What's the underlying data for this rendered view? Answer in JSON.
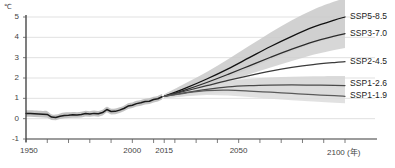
{
  "chart_data": {
    "type": "line",
    "title": "",
    "subtitle": "",
    "xlabel": "年",
    "ylabel": "℃",
    "unit": "℃",
    "xlim": [
      1950,
      2100
    ],
    "ylim": [
      -1,
      5
    ],
    "grid": true,
    "grid_values": [
      0,
      1,
      2,
      3,
      4,
      5
    ],
    "legend_position": "right-inline",
    "annotations": [
      {
        "text": "historical observations end and projections begin",
        "x": 2015
      }
    ],
    "x_tick_labels": [
      "1950",
      "2000",
      "2015",
      "2050",
      "2100"
    ],
    "x_tick_label_extra": "(年)",
    "x_minor_tick_step": 10,
    "y_tick_labels": [
      "5",
      "4",
      "3",
      "2",
      "1",
      "0",
      "-1"
    ],
    "historical": {
      "name": "historical",
      "color": "#1a1a1a",
      "band_color": "#b8b8b8",
      "x": [
        1950,
        1952,
        1954,
        1956,
        1958,
        1960,
        1962,
        1964,
        1966,
        1968,
        1970,
        1972,
        1974,
        1976,
        1978,
        1980,
        1982,
        1984,
        1986,
        1988,
        1990,
        1992,
        1994,
        1996,
        1998,
        2000,
        2002,
        2004,
        2006,
        2008,
        2010,
        2012,
        2014
      ],
      "values": [
        0.26,
        0.25,
        0.24,
        0.23,
        0.22,
        0.21,
        0.08,
        0.06,
        0.12,
        0.16,
        0.17,
        0.19,
        0.18,
        0.2,
        0.25,
        0.23,
        0.26,
        0.24,
        0.3,
        0.45,
        0.35,
        0.36,
        0.42,
        0.5,
        0.62,
        0.66,
        0.74,
        0.78,
        0.84,
        0.86,
        0.94,
        0.98,
        1.08
      ],
      "band_lower": [
        0.1,
        0.09,
        0.08,
        0.07,
        0.06,
        0.05,
        -0.06,
        -0.08,
        -0.02,
        0.02,
        0.03,
        0.05,
        0.04,
        0.06,
        0.11,
        0.09,
        0.12,
        0.1,
        0.16,
        0.31,
        0.21,
        0.22,
        0.28,
        0.36,
        0.48,
        0.52,
        0.6,
        0.64,
        0.7,
        0.72,
        0.8,
        0.84,
        0.94
      ],
      "band_upper": [
        0.42,
        0.41,
        0.4,
        0.39,
        0.38,
        0.37,
        0.22,
        0.2,
        0.26,
        0.3,
        0.31,
        0.33,
        0.32,
        0.34,
        0.39,
        0.37,
        0.4,
        0.38,
        0.44,
        0.59,
        0.49,
        0.5,
        0.56,
        0.64,
        0.76,
        0.8,
        0.88,
        0.92,
        0.98,
        1.0,
        1.08,
        1.12,
        1.22
      ]
    },
    "series": [
      {
        "name": "SSP5-8.5",
        "label": "SSP5-8.5",
        "color": "#111111",
        "band_color": "#c9c9c9",
        "show_band": true,
        "x": [
          2015,
          2025,
          2035,
          2045,
          2055,
          2065,
          2075,
          2085,
          2095,
          2100
        ],
        "values": [
          1.1,
          1.5,
          1.95,
          2.45,
          3.0,
          3.55,
          4.05,
          4.5,
          4.85,
          5.0
        ],
        "band_lower": [
          1.0,
          1.28,
          1.62,
          2.02,
          2.46,
          2.9,
          3.32,
          3.7,
          4.0,
          4.12
        ],
        "band_upper": [
          1.2,
          1.74,
          2.3,
          2.92,
          3.58,
          4.24,
          4.84,
          5.36,
          5.76,
          5.92
        ],
        "end_value": 5.0
      },
      {
        "name": "SSP3-7.0",
        "label": "SSP3-7.0",
        "color": "#2b2b2b",
        "band_color": "#d0d0d0",
        "show_band": true,
        "x": [
          2015,
          2025,
          2035,
          2045,
          2055,
          2065,
          2075,
          2085,
          2095,
          2100
        ],
        "values": [
          1.1,
          1.42,
          1.78,
          2.18,
          2.6,
          3.02,
          3.42,
          3.78,
          4.06,
          4.18
        ],
        "band_lower": [
          1.0,
          1.24,
          1.52,
          1.84,
          2.18,
          2.52,
          2.84,
          3.14,
          3.38,
          3.48
        ],
        "band_upper": [
          1.2,
          1.62,
          2.06,
          2.54,
          3.04,
          3.54,
          4.02,
          4.46,
          4.8,
          4.94
        ],
        "end_value": 4.2
      },
      {
        "name": "SSP2-4.5",
        "label": "SSP2-4.5",
        "color": "#3a3a3a",
        "band_color": "#d8d8d8",
        "show_band": false,
        "x": [
          2015,
          2025,
          2035,
          2045,
          2055,
          2065,
          2075,
          2085,
          2095,
          2100
        ],
        "values": [
          1.1,
          1.36,
          1.62,
          1.88,
          2.12,
          2.34,
          2.52,
          2.66,
          2.76,
          2.8
        ],
        "band_lower": [
          1.0,
          1.18,
          1.38,
          1.58,
          1.76,
          1.92,
          2.06,
          2.16,
          2.22,
          2.24
        ],
        "band_upper": [
          1.2,
          1.56,
          1.9,
          2.22,
          2.52,
          2.8,
          3.02,
          3.2,
          3.32,
          3.38
        ],
        "end_value": 2.8
      },
      {
        "name": "SSP1-2.6",
        "label": "SSP1-2.6",
        "color": "#4a4a4a",
        "band_color": "#d5d5d5",
        "show_band": true,
        "x": [
          2015,
          2025,
          2035,
          2045,
          2055,
          2065,
          2075,
          2085,
          2095,
          2100
        ],
        "values": [
          1.1,
          1.28,
          1.44,
          1.56,
          1.62,
          1.65,
          1.66,
          1.65,
          1.64,
          1.63
        ],
        "band_lower": [
          1.0,
          1.12,
          1.22,
          1.28,
          1.3,
          1.28,
          1.26,
          1.22,
          1.18,
          1.16
        ],
        "band_upper": [
          1.2,
          1.46,
          1.68,
          1.86,
          1.96,
          2.02,
          2.06,
          2.08,
          2.1,
          2.1
        ],
        "end_value": 1.6
      },
      {
        "name": "SSP1-1.9",
        "label": "SSP1-1.9",
        "color": "#5a5a5a",
        "band_color": "#dcdcdc",
        "show_band": true,
        "x": [
          2015,
          2025,
          2035,
          2045,
          2055,
          2065,
          2075,
          2085,
          2095,
          2100
        ],
        "values": [
          1.1,
          1.26,
          1.38,
          1.4,
          1.36,
          1.3,
          1.24,
          1.18,
          1.13,
          1.1
        ],
        "band_lower": [
          1.0,
          1.1,
          1.16,
          1.14,
          1.06,
          0.98,
          0.9,
          0.84,
          0.78,
          0.76
        ],
        "band_upper": [
          1.2,
          1.44,
          1.62,
          1.68,
          1.68,
          1.64,
          1.6,
          1.56,
          1.52,
          1.5
        ],
        "end_value": 1.1
      }
    ]
  },
  "axis": {
    "unit_label": "℃",
    "x_axis_end_label": "2100 (年)"
  }
}
